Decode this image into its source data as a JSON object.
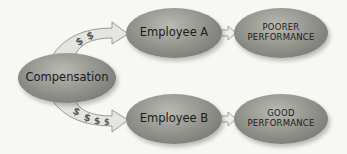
{
  "nodes": {
    "compensation": {
      "label": "Compensation"
    },
    "employee_a": {
      "label": "Employee A"
    },
    "employee_b": {
      "label": "Employee B"
    },
    "poorer": {
      "line1": "POORER",
      "line2": "PERFORMANCE"
    },
    "good": {
      "line1": "GOOD",
      "line2": "PERFORMANCE"
    }
  },
  "arrows": {
    "to_a": {
      "symbols": "$ $",
      "count": 2
    },
    "to_b": {
      "symbols": "$ $ $ $",
      "count": 4
    }
  },
  "colors": {
    "node": "#8d8e88",
    "arrow_fill": "#e4e5e0",
    "arrow_stroke": "#9a9b96"
  }
}
